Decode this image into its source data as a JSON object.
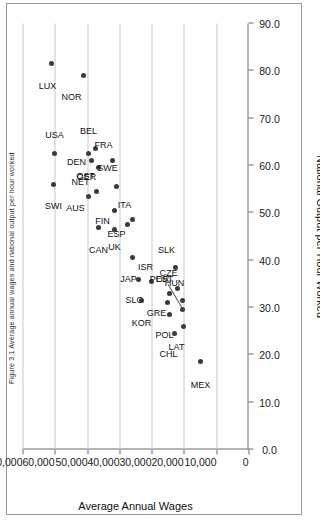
{
  "figure": {
    "title_sliver": "Figure 3.1  Average annual wages and national output per hour worked"
  },
  "chart_data": {
    "type": "scatter",
    "title": "",
    "xlabel": "National Output per Hour Worked",
    "ylabel": "Average Annual Wages",
    "xlim": [
      0.0,
      90.0
    ],
    "ylim": [
      0,
      70000
    ],
    "xticks": [
      "0.0",
      "10.0",
      "20.0",
      "30.0",
      "40.0",
      "50.0",
      "60.0",
      "70.0",
      "80.0",
      "90.0"
    ],
    "xtick_values": [
      0,
      10,
      20,
      30,
      40,
      50,
      60,
      70,
      80,
      90
    ],
    "yticks": [
      "0",
      "10,000",
      "20,000",
      "30,000",
      "40,000",
      "50,000",
      "60,000",
      "70,000"
    ],
    "ytick_values": [
      0,
      10000,
      20000,
      30000,
      40000,
      50000,
      60000,
      70000
    ],
    "grid": "horizontal",
    "legend": "none",
    "marker_color": "#3a3a3a",
    "points": [
      {
        "label": "LUX",
        "x": 81.5,
        "y": 61000,
        "lx": -15,
        "ly": -4
      },
      {
        "label": "NOR",
        "x": 79.0,
        "y": 51000,
        "lx": -15,
        "ly": -12
      },
      {
        "label": "USA",
        "x": 62.5,
        "y": 60000,
        "lx": 9,
        "ly": 0
      },
      {
        "label": "SWI",
        "x": 56.0,
        "y": 60500,
        "lx": -14,
        "ly": 0
      },
      {
        "label": "DEN",
        "x": 62.5,
        "y": 49500,
        "lx": -2,
        "ly": -12
      },
      {
        "label": "NET",
        "x": 61.0,
        "y": 48500,
        "lx": -14,
        "ly": -11
      },
      {
        "label": "BEL",
        "x": 63.5,
        "y": 47500,
        "lx": 9,
        "ly": -7
      },
      {
        "label": "GER",
        "x": 59.5,
        "y": 46500,
        "lx": -2,
        "ly": -12
      },
      {
        "label": "AUS",
        "x": 53.5,
        "y": 49500,
        "lx": -5,
        "ly": -13
      },
      {
        "label": "OST",
        "x": 54.5,
        "y": 47000,
        "lx": 6,
        "ly": -11
      },
      {
        "label": "FRA",
        "x": 61.0,
        "y": 42000,
        "lx": 7,
        "ly": -9
      },
      {
        "label": "SWE",
        "x": 55.5,
        "y": 41000,
        "lx": 8,
        "ly": -9
      },
      {
        "label": "CAN",
        "x": 47.0,
        "y": 46500,
        "lx": -16,
        "ly": 0
      },
      {
        "label": "FIN",
        "x": 50.5,
        "y": 41500,
        "lx": -2,
        "ly": -12
      },
      {
        "label": "UK",
        "x": 46.5,
        "y": 41500,
        "lx": -13,
        "ly": 0
      },
      {
        "label": "ESP",
        "x": 47.5,
        "y": 37500,
        "lx": -3,
        "ly": -11
      },
      {
        "label": "ITA",
        "x": 48.5,
        "y": 36000,
        "lx": 8,
        "ly": -8
      },
      {
        "label": "JAP",
        "x": 40.5,
        "y": 36000,
        "lx": -14,
        "ly": -4
      },
      {
        "label": "SLO",
        "x": 36.0,
        "y": 34000,
        "lx": -14,
        "ly": -4
      },
      {
        "label": "ISR",
        "x": 35.5,
        "y": 30000,
        "lx": 7,
        "ly": -6
      },
      {
        "label": "KOR",
        "x": 31.5,
        "y": 33000,
        "lx": -16,
        "ly": 0
      },
      {
        "label": "GRE",
        "x": 31.0,
        "y": 25000,
        "lx": -4,
        "ly": -11
      },
      {
        "label": "POR",
        "x": 33.0,
        "y": 24500,
        "lx": 5,
        "ly": -10
      },
      {
        "label": "SLK",
        "x": 38.5,
        "y": 22500,
        "lx": 9,
        "ly": -9
      },
      {
        "label": "CZE",
        "x": 34.0,
        "y": 22000,
        "lx": 7,
        "ly": -9
      },
      {
        "label": "HUN",
        "x": 31.5,
        "y": 20500,
        "lx": 8,
        "ly": -8
      },
      {
        "label": "POL",
        "x": 28.5,
        "y": 24500,
        "lx": -14,
        "ly": -5
      },
      {
        "label": "CHL",
        "x": 24.5,
        "y": 23000,
        "lx": -14,
        "ly": -6
      },
      {
        "label": "LAT",
        "x": 26.0,
        "y": 20000,
        "lx": -12,
        "ly": -7
      },
      {
        "label": "EST",
        "x": 29.5,
        "y": 20500,
        "lx": 22,
        "ly": -18
      },
      {
        "label": "MEX",
        "x": 18.5,
        "y": 15000,
        "lx": -16,
        "ly": 0
      }
    ]
  }
}
